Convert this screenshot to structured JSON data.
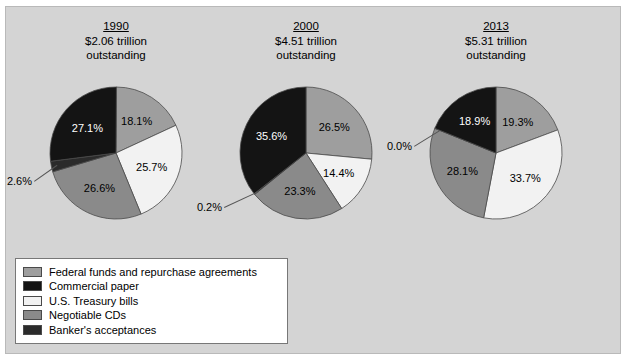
{
  "figure": {
    "background_color": "#d4d4d4",
    "border_color": "#b9b9b9"
  },
  "legend": {
    "items": [
      {
        "label": "Federal funds and repurchase agreements",
        "color": "#9e9e9e",
        "key": "fed-funds-repo"
      },
      {
        "label": "Commercial paper",
        "color": "#141414",
        "key": "commercial-paper"
      },
      {
        "label": "U.S. Treasury bills",
        "color": "#f2f2f2",
        "key": "treasury-bills"
      },
      {
        "label": "Negotiable CDs",
        "color": "#8a8a8a",
        "key": "negotiable-cds"
      },
      {
        "label": "Banker's acceptances",
        "color": "#2b2b2b",
        "key": "bankers-acceptances"
      }
    ]
  },
  "chart_data": {
    "type": "pie",
    "legend_position": "bottom-left",
    "categories": [
      "Federal funds and repurchase agreements",
      "Commercial paper",
      "U.S. Treasury bills",
      "Negotiable CDs",
      "Banker's acceptances"
    ],
    "colors": [
      "#9e9e9e",
      "#141414",
      "#f2f2f2",
      "#8a8a8a",
      "#2b2b2b"
    ],
    "slice_order": [
      "Federal funds and repurchase agreements",
      "U.S. Treasury bills",
      "Negotiable CDs",
      "Banker's acceptances",
      "Commercial paper"
    ],
    "start_angle_deg": 0,
    "direction": "clockwise",
    "pies": [
      {
        "year": "1990",
        "amount": "$2.06 trillion",
        "outstanding": "outstanding",
        "values": [
          18.1,
          27.1,
          25.7,
          26.6,
          2.6
        ],
        "slices": [
          {
            "label": "18.1%",
            "value": 18.1,
            "category": "Federal funds and repurchase agreements",
            "color": "#9e9e9e",
            "text_color": "dark",
            "callout": false
          },
          {
            "label": "25.7%",
            "value": 25.7,
            "category": "U.S. Treasury bills",
            "color": "#f2f2f2",
            "text_color": "dark",
            "callout": false
          },
          {
            "label": "26.6%",
            "value": 26.6,
            "category": "Negotiable CDs",
            "color": "#8a8a8a",
            "text_color": "dark",
            "callout": false
          },
          {
            "label": "2.6%",
            "value": 2.6,
            "category": "Banker's acceptances",
            "color": "#2b2b2b",
            "text_color": "dark",
            "callout": true
          },
          {
            "label": "27.1%",
            "value": 27.1,
            "category": "Commercial paper",
            "color": "#141414",
            "text_color": "light",
            "callout": false
          }
        ]
      },
      {
        "year": "2000",
        "amount": "$4.51 trillion",
        "outstanding": "outstanding",
        "values": [
          26.5,
          35.6,
          14.4,
          23.3,
          0.2
        ],
        "slices": [
          {
            "label": "26.5%",
            "value": 26.5,
            "category": "Federal funds and repurchase agreements",
            "color": "#9e9e9e",
            "text_color": "dark",
            "callout": false
          },
          {
            "label": "14.4%",
            "value": 14.4,
            "category": "U.S. Treasury bills",
            "color": "#f2f2f2",
            "text_color": "dark",
            "callout": false
          },
          {
            "label": "23.3%",
            "value": 23.3,
            "category": "Negotiable CDs",
            "color": "#8a8a8a",
            "text_color": "dark",
            "callout": false
          },
          {
            "label": "0.2%",
            "value": 0.2,
            "category": "Banker's acceptances",
            "color": "#2b2b2b",
            "text_color": "dark",
            "callout": true
          },
          {
            "label": "35.6%",
            "value": 35.6,
            "category": "Commercial paper",
            "color": "#141414",
            "text_color": "light",
            "callout": false
          }
        ]
      },
      {
        "year": "2013",
        "amount": "$5.31 trillion",
        "outstanding": "outstanding",
        "values": [
          19.3,
          18.9,
          33.7,
          28.1,
          0.0
        ],
        "slices": [
          {
            "label": "19.3%",
            "value": 19.3,
            "category": "Federal funds and repurchase agreements",
            "color": "#9e9e9e",
            "text_color": "dark",
            "callout": false
          },
          {
            "label": "33.7%",
            "value": 33.7,
            "category": "U.S. Treasury bills",
            "color": "#f2f2f2",
            "text_color": "dark",
            "callout": false
          },
          {
            "label": "28.1%",
            "value": 28.1,
            "category": "Negotiable CDs",
            "color": "#8a8a8a",
            "text_color": "dark",
            "callout": false
          },
          {
            "label": "0.0%",
            "value": 0.0,
            "category": "Banker's acceptances",
            "color": "#2b2b2b",
            "text_color": "dark",
            "callout": true
          },
          {
            "label": "18.9%",
            "value": 18.9,
            "category": "Commercial paper",
            "color": "#141414",
            "text_color": "light",
            "callout": false
          }
        ]
      }
    ]
  }
}
